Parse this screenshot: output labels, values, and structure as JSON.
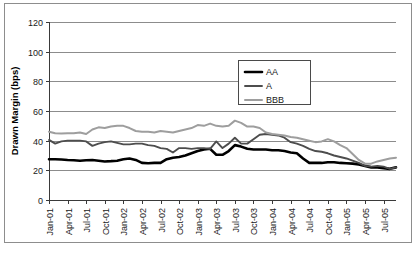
{
  "chart_data": {
    "type": "line",
    "title": "",
    "xlabel": "",
    "ylabel": "Drawn Margin (bps)",
    "ylim": [
      0,
      120
    ],
    "ytick_values": [
      0,
      20,
      40,
      60,
      80,
      100,
      120
    ],
    "ytick_labels": [
      "0",
      "20",
      "40",
      "60",
      "80",
      "100",
      "120"
    ],
    "grid": true,
    "legend_position": "upper-center",
    "x_axis_type": "monthly",
    "x_start": "Jan-01",
    "x_end": "Sep-05",
    "xtick_labels": [
      "Jan-01",
      "Apr-01",
      "Jul-01",
      "Oct-01",
      "Jan-02",
      "Apr-02",
      "Jul-02",
      "Oct-02",
      "Jan-03",
      "Apr-03",
      "Jul-03",
      "Oct-03",
      "Jan-04",
      "Apr-04",
      "Jul-04",
      "Oct-04",
      "Jan-05",
      "Apr-05",
      "Jul-05"
    ],
    "x_months": [
      "Jan-01",
      "Feb-01",
      "Mar-01",
      "Apr-01",
      "May-01",
      "Jun-01",
      "Jul-01",
      "Aug-01",
      "Sep-01",
      "Oct-01",
      "Nov-01",
      "Dec-01",
      "Jan-02",
      "Feb-02",
      "Mar-02",
      "Apr-02",
      "May-02",
      "Jun-02",
      "Jul-02",
      "Aug-02",
      "Sep-02",
      "Oct-02",
      "Nov-02",
      "Dec-02",
      "Jan-03",
      "Feb-03",
      "Mar-03",
      "Apr-03",
      "May-03",
      "Jun-03",
      "Jul-03",
      "Aug-03",
      "Sep-03",
      "Oct-03",
      "Nov-03",
      "Dec-03",
      "Jan-04",
      "Feb-04",
      "Mar-04",
      "Apr-04",
      "May-04",
      "Jun-04",
      "Jul-04",
      "Aug-04",
      "Sep-04",
      "Oct-04",
      "Nov-04",
      "Dec-04",
      "Jan-05",
      "Feb-05",
      "Mar-05",
      "Apr-05",
      "May-05",
      "Jun-05",
      "Jul-05",
      "Aug-05",
      "Sep-05"
    ],
    "series": [
      {
        "name": "AA",
        "color": "#000000",
        "width": 2.6,
        "values": [
          27.5,
          27.5,
          27.3,
          27.0,
          26.8,
          26.5,
          26.8,
          27.0,
          26.5,
          26.0,
          26.2,
          26.5,
          27.5,
          28.0,
          27.0,
          25.0,
          24.8,
          25.0,
          25.0,
          27.5,
          28.5,
          29.0,
          30.0,
          31.5,
          33.0,
          34.0,
          34.5,
          30.5,
          30.5,
          33.0,
          37.0,
          36.0,
          34.5,
          34.0,
          34.0,
          34.0,
          33.5,
          33.5,
          33.0,
          32.0,
          31.5,
          28.0,
          25.0,
          25.0,
          25.0,
          25.5,
          25.5,
          25.0,
          24.8,
          24.5,
          24.0,
          23.0,
          22.0,
          22.0,
          21.5,
          21.0,
          22.0
        ]
      },
      {
        "name": "A",
        "color": "#4d4d4d",
        "width": 1.9,
        "values": [
          40.5,
          38.0,
          39.5,
          40.0,
          40.0,
          40.0,
          39.5,
          36.5,
          38.0,
          39.0,
          39.5,
          38.5,
          37.5,
          37.5,
          38.0,
          38.0,
          37.0,
          36.5,
          35.0,
          34.5,
          32.0,
          35.0,
          35.0,
          34.5,
          35.0,
          35.0,
          34.5,
          39.5,
          35.0,
          38.0,
          42.0,
          38.0,
          38.0,
          41.0,
          44.0,
          44.5,
          44.0,
          43.5,
          42.0,
          39.0,
          38.0,
          36.5,
          34.5,
          33.0,
          32.5,
          31.5,
          30.0,
          29.0,
          28.0,
          26.5,
          25.0,
          23.0,
          22.5,
          23.0,
          22.5,
          21.0,
          22.0
        ]
      },
      {
        "name": "BBB",
        "color": "#9e9e9e",
        "width": 2.0,
        "values": [
          46.0,
          45.0,
          44.8,
          45.0,
          45.0,
          45.5,
          44.5,
          47.5,
          49.0,
          48.5,
          49.5,
          50.0,
          50.0,
          48.5,
          46.5,
          46.0,
          46.0,
          45.5,
          46.5,
          46.0,
          45.5,
          46.5,
          47.5,
          48.5,
          50.5,
          50.0,
          51.5,
          50.0,
          49.5,
          50.0,
          53.5,
          52.0,
          49.5,
          49.5,
          48.5,
          45.5,
          44.5,
          44.0,
          43.5,
          42.5,
          42.0,
          41.0,
          40.0,
          39.0,
          39.5,
          41.0,
          39.5,
          37.0,
          35.0,
          31.0,
          27.0,
          24.5,
          24.5,
          26.0,
          27.0,
          28.0,
          28.5
        ]
      }
    ]
  },
  "legend": {
    "items": [
      {
        "label": "AA"
      },
      {
        "label": "A"
      },
      {
        "label": "BBB"
      }
    ]
  }
}
